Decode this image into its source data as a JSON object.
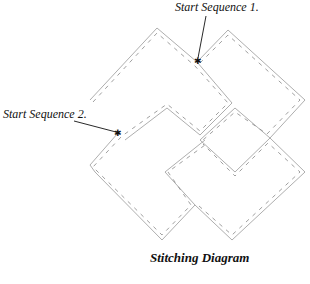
{
  "title": "Stitching Diagram",
  "annotations": [
    {
      "label": "Start Sequence 1.",
      "marker": "star"
    },
    {
      "label": "Start Sequence 2.",
      "marker": "star"
    }
  ],
  "colors": {
    "line": "#999999",
    "text": "#111111",
    "background": "#ffffff"
  }
}
